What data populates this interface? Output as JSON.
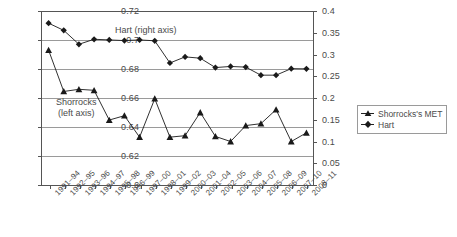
{
  "chart_data": {
    "type": "line",
    "title": "",
    "xlabel": "",
    "ylabel": "",
    "grid": true,
    "legend_position": "right",
    "categories": [
      "1991–94",
      "1992–95",
      "1993–96",
      "1994–97",
      "1995–98",
      "1996–99",
      "1997–00",
      "1998–01",
      "1999–02",
      "2000–03",
      "2001–04",
      "2002–05",
      "2003–06",
      "2004–07",
      "2005–08",
      "2006–09",
      "2007–10",
      "2008–11"
    ],
    "axes": {
      "left": {
        "label": "",
        "min": 0.6,
        "max": 0.72,
        "step": 0.02,
        "ticks": [
          "0.6",
          "0.62",
          "0.64",
          "0.66",
          "0.68",
          "0.7",
          "0.72"
        ],
        "tick_values": [
          0.6,
          0.62,
          0.64,
          0.66,
          0.68,
          0.7,
          0.72
        ]
      },
      "right": {
        "label": "",
        "min": 0,
        "max": 0.4,
        "step": 0.05,
        "ticks": [
          "0",
          "0.05",
          "0.1",
          "0.15",
          "0.2",
          "0.25",
          "0.3",
          "0.35",
          "0.4"
        ],
        "tick_values": [
          0,
          0.05,
          0.1,
          0.15,
          0.2,
          0.25,
          0.3,
          0.35,
          0.4
        ]
      }
    },
    "series": [
      {
        "name": "Shorrocks's MET",
        "axis": "left",
        "marker": "triangle",
        "color": "#1a1a1a",
        "values": [
          0.693,
          0.6645,
          0.666,
          0.6653,
          0.6448,
          0.6478,
          0.633,
          0.6595,
          0.633,
          0.634,
          0.65,
          0.6335,
          0.63,
          0.641,
          0.6423,
          0.652,
          0.63,
          0.636
        ]
      },
      {
        "name": "Hart",
        "axis": "right",
        "marker": "diamond",
        "color": "#1a1a1a",
        "values": [
          0.372,
          0.3555,
          0.3235,
          0.335,
          0.3335,
          0.332,
          0.3335,
          0.3315,
          0.2805,
          0.2945,
          0.2915,
          0.27,
          0.2725,
          0.271,
          0.2525,
          0.2525,
          0.2675,
          0.267
        ]
      }
    ],
    "annotations": [
      {
        "text": "Hart (right axis)",
        "series": "Hart"
      },
      {
        "text_line1": "Shorrocks",
        "text_line2": "(left axis)",
        "series": "Shorrocks's MET"
      }
    ]
  },
  "legend": {
    "items": [
      {
        "label": "Shorrocks's MET",
        "marker": "triangle"
      },
      {
        "label": "Hart",
        "marker": "diamond"
      }
    ]
  },
  "annotation_hart": "Hart (right axis)",
  "annotation_shorrocks_line1": "Shorrocks",
  "annotation_shorrocks_line2": "(left axis)"
}
